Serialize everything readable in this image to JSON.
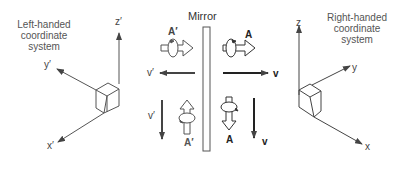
{
  "diagram": {
    "left_system": {
      "title_line1": "Left-handed",
      "title_line2": "coordinate",
      "title_line3": "system",
      "axis_z": "z′",
      "axis_y": "y′",
      "axis_x": "x′"
    },
    "right_system": {
      "title_line1": "Right-handed",
      "title_line2": "coordinate",
      "title_line3": "system",
      "axis_z": "z",
      "axis_y": "y",
      "axis_x": "x"
    },
    "mirror": {
      "label": "Mirror"
    },
    "vectors": {
      "left_top_axial": "A′",
      "left_top_velocity": "v′",
      "left_bottom_velocity": "v′",
      "left_bottom_axial": "A′",
      "right_top_axial": "A",
      "right_top_velocity": "v",
      "right_bottom_axial": "A",
      "right_bottom_velocity": "v"
    },
    "colors": {
      "line": "#444444",
      "mirror": "#555555",
      "background": "#ffffff"
    }
  }
}
